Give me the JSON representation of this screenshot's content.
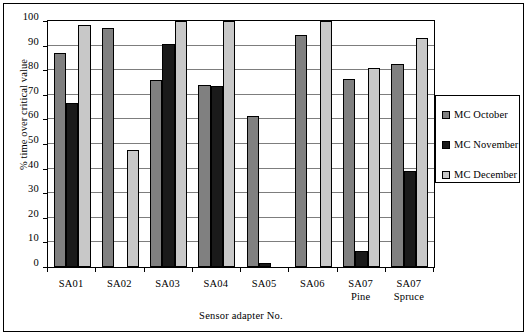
{
  "chart_data": {
    "type": "bar",
    "title": "",
    "xlabel": "Sensor adapter No.",
    "ylabel": "% time over critical value",
    "ylim": [
      0,
      100
    ],
    "ytick_step": 10,
    "yticks": [
      0,
      10,
      20,
      30,
      40,
      50,
      60,
      70,
      80,
      90,
      100
    ],
    "grid": true,
    "grid_axis": "y",
    "legend_position": "right",
    "categories": [
      {
        "line1": "SA01",
        "line2": ""
      },
      {
        "line1": "SA02",
        "line2": ""
      },
      {
        "line1": "SA03",
        "line2": ""
      },
      {
        "line1": "SA04",
        "line2": ""
      },
      {
        "line1": "SA05",
        "line2": ""
      },
      {
        "line1": "SA06",
        "line2": ""
      },
      {
        "line1": "SA07",
        "line2": "Pine"
      },
      {
        "line1": "SA07",
        "line2": "Spruce"
      }
    ],
    "category_labels": [
      "SA01",
      "SA02",
      "SA03",
      "SA04",
      "SA05",
      "SA06",
      "SA07 Pine",
      "SA07 Spruce"
    ],
    "series": [
      {
        "name": "MC October",
        "color": "#808080",
        "values": [
          87,
          97,
          76,
          74,
          61.5,
          94.5,
          76.5,
          82.5
        ]
      },
      {
        "name": "MC November",
        "color": "#1a1a1a",
        "values": [
          66.5,
          0,
          90.5,
          73.5,
          1.5,
          0,
          6.5,
          39
        ]
      },
      {
        "name": "MC December",
        "color": "#c8c8c8",
        "values": [
          98.5,
          47.5,
          100,
          100,
          0,
          100,
          81,
          93
        ]
      }
    ]
  },
  "legend": {
    "entries": [
      {
        "label": "MC October",
        "color": "#808080"
      },
      {
        "label": "MC November",
        "color": "#1a1a1a"
      },
      {
        "label": "MC December",
        "color": "#c8c8c8"
      }
    ]
  }
}
